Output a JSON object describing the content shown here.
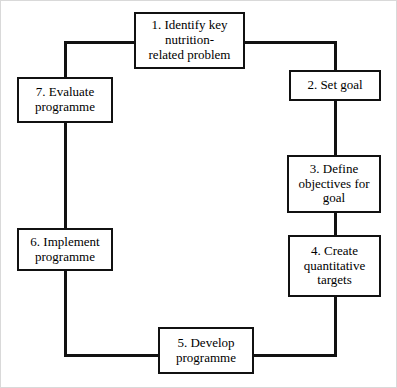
{
  "diagram": {
    "type": "cycle-flowchart",
    "step_count": 7,
    "style": {
      "box_border_color": "#111111",
      "box_fill_color": "#ffffff",
      "connector_color": "#111111",
      "text_color": "#000000",
      "page_background": "#ffffff"
    },
    "nodes": [
      {
        "id": "1",
        "number": "1.",
        "label": "1. Identify key\nnutrition-\nrelated problem",
        "lines": [
          "1. Identify key",
          "nutrition-",
          "related problem"
        ]
      },
      {
        "id": "2",
        "number": "2.",
        "label": "2. Set goal",
        "lines": [
          "2. Set goal"
        ]
      },
      {
        "id": "3",
        "number": "3.",
        "label": "3. Define\nobjectives for\ngoal",
        "lines": [
          "3. Define",
          "objectives for",
          "goal"
        ]
      },
      {
        "id": "4",
        "number": "4.",
        "label": "4. Create\nquantitative\ntargets",
        "lines": [
          "4. Create",
          "quantitative",
          "targets"
        ]
      },
      {
        "id": "5",
        "number": "5.",
        "label": "5. Develop\nprogramme",
        "lines": [
          "5. Develop",
          "programme"
        ]
      },
      {
        "id": "6",
        "number": "6.",
        "label": "6. Implement\nprogramme",
        "lines": [
          "6. Implement",
          "programme"
        ]
      },
      {
        "id": "7",
        "number": "7.",
        "label": "7. Evaluate\nprogramme",
        "lines": [
          "7. Evaluate",
          "programme"
        ]
      }
    ],
    "edges": [
      {
        "from": "1",
        "to": "2",
        "path": "right-then-down"
      },
      {
        "from": "2",
        "to": "3",
        "path": "down"
      },
      {
        "from": "3",
        "to": "4",
        "path": "down"
      },
      {
        "from": "4",
        "to": "5",
        "path": "down-then-left"
      },
      {
        "from": "5",
        "to": "6",
        "path": "left-then-up"
      },
      {
        "from": "6",
        "to": "7",
        "path": "up"
      },
      {
        "from": "7",
        "to": "1",
        "path": "up-then-right"
      }
    ]
  }
}
